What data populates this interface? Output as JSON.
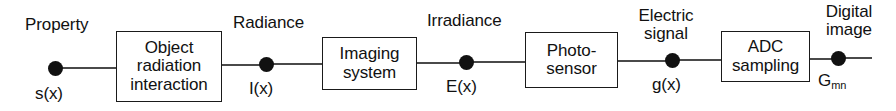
{
  "diagram": {
    "line_color": "#4a4a4a",
    "box_border_color": "#1a1a1a",
    "node_color": "#111111",
    "stages": [
      {
        "id": "object-radiation-interaction",
        "lines": [
          "Object",
          "radiation",
          "interaction"
        ]
      },
      {
        "id": "imaging-system",
        "lines": [
          "Imaging",
          "system"
        ]
      },
      {
        "id": "photo-sensor",
        "lines": [
          "Photo-",
          "sensor"
        ]
      },
      {
        "id": "adc-sampling",
        "lines": [
          "ADC",
          "sampling"
        ]
      }
    ],
    "signals": [
      {
        "id": "property",
        "name_lines": [
          "Property"
        ],
        "symbol": "s(x)",
        "symbol_sub": ""
      },
      {
        "id": "radiance",
        "name_lines": [
          "Radiance"
        ],
        "symbol": "I(x)",
        "symbol_sub": ""
      },
      {
        "id": "irradiance",
        "name_lines": [
          "Irradiance"
        ],
        "symbol": "E(x)",
        "symbol_sub": ""
      },
      {
        "id": "electric-signal",
        "name_lines": [
          "Electric",
          "signal"
        ],
        "symbol": "g(x)",
        "symbol_sub": ""
      },
      {
        "id": "digital-image",
        "name_lines": [
          "Digital",
          "image"
        ],
        "symbol": "G",
        "symbol_sub": "mn"
      }
    ]
  }
}
